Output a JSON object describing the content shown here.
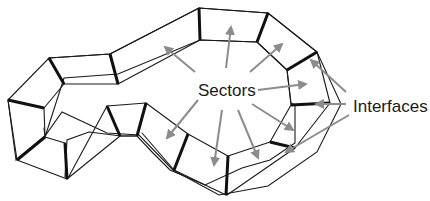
{
  "diagram": {
    "labels": {
      "sectors": "Sectors",
      "interfaces": "Interfaces"
    },
    "colors": {
      "edges": "#1a1a1a",
      "interfaces": "#111111",
      "arrows": "#8c8c8c",
      "background": "#ffffff"
    }
  }
}
